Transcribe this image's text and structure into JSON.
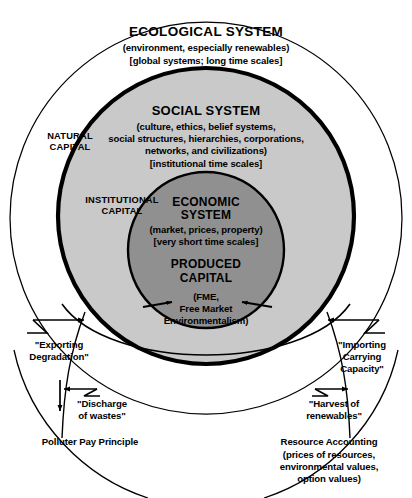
{
  "diagram": {
    "colors": {
      "ecological_fill": "#ffffff",
      "social_fill": "#c9c9c9",
      "economic_fill": "#909090",
      "stroke": "#000000"
    },
    "rings": {
      "ecological": {
        "heading": "ECOLOGICAL SYSTEM",
        "line2": "(environment, especially renewables)",
        "line3": "[global systems; long time scales]"
      },
      "social": {
        "heading": "SOCIAL SYSTEM",
        "line2": "(culture, ethics, belief systems,",
        "line3": "social structures, hierarchies, corporations,",
        "line4": "networks, and civilizations)",
        "line5": "[institutional time scales]"
      },
      "economic": {
        "heading_line1": "ECONOMIC",
        "heading_line2": "SYSTEM",
        "line2": "(market, prices, property)",
        "line3": "[very short time scales]",
        "produced_line1": "PRODUCED",
        "produced_line2": "CAPITAL",
        "fme_line1": "(FME,",
        "fme_line2": "Free Market",
        "fme_line3": "Environmentalism)"
      }
    },
    "capital_labels": {
      "natural_line1": "NATURAL",
      "natural_line2": "CAPITAL",
      "institutional_line1": "INSTITUTIONAL",
      "institutional_line2": "CAPITAL"
    },
    "flows": {
      "exporting_line1": "\"Exporting",
      "exporting_line2": "Degradation\"",
      "importing_line1": "\"Importing",
      "importing_line2": "Carrying",
      "importing_line3": "Capacity\"",
      "discharge_line1": "\"Discharge",
      "discharge_line2": "of wastes\"",
      "harvest_line1": "\"Harvest of",
      "harvest_line2": "renewables\""
    },
    "footers": {
      "left": "Polluter Pay Principle",
      "right_line1": "Resource Accounting",
      "right_line2": "(prices of resources,",
      "right_line3": "environmental values,",
      "right_line4": "option values)"
    }
  }
}
